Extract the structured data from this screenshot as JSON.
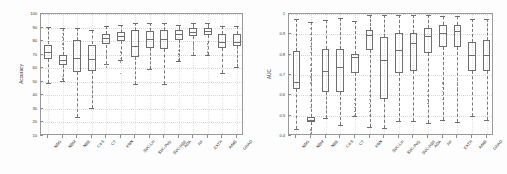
{
  "figure": {
    "background_color": "#fdfdfd",
    "box_line_color": "#6f6f6f",
    "whisker_color": "#7a7a7a",
    "outlier_color": "#8a8a8a",
    "axis_color": "#9a9a9a",
    "grid_color": "#d8d8d8"
  },
  "chart_data": [
    {
      "type": "box",
      "panel": "left",
      "title": "",
      "xlabel": "",
      "ylabel": "Accuracy",
      "ylim": [
        10,
        100
      ],
      "yticks": [
        10,
        20,
        30,
        40,
        50,
        60,
        70,
        80,
        90,
        100
      ],
      "ytick_labels": [
        "10",
        "20",
        "30",
        "40",
        "50",
        "60",
        "70",
        "80",
        "90",
        "100"
      ],
      "grid": true,
      "legend": "none",
      "categories": [
        "NBG",
        "NBM",
        "NBB",
        "C4.5",
        "CT",
        "KNN",
        "SVC-Lin",
        "SVC-Poly",
        "SVC-RBF",
        "ADA",
        "RF",
        "EXTR",
        "AdaB",
        "GRAD"
      ],
      "boxes": [
        {
          "category": "NBG",
          "whisker_low": 49.0,
          "q1": 66.5,
          "median": 72.0,
          "q3": 77.5,
          "whisker_high": 90.5,
          "outliers": [
            58.0,
            55.5,
            50.0
          ]
        },
        {
          "category": "NBM",
          "whisker_low": 50.5,
          "q1": 62.5,
          "median": 66.0,
          "q3": 69.5,
          "whisker_high": 90.0,
          "outliers": [
            88.0,
            85.5,
            83.0,
            80.5,
            78.0,
            75.5,
            54.0,
            52.0,
            50.0
          ]
        },
        {
          "category": "NBB",
          "whisker_low": 24.0,
          "q1": 57.5,
          "median": 67.5,
          "q3": 80.5,
          "whisker_high": 90.0,
          "outliers": []
        },
        {
          "category": "C4.5",
          "whisker_low": 31.0,
          "q1": 58.0,
          "median": 66.5,
          "q3": 77.5,
          "whisker_high": 88.0,
          "outliers": []
        },
        {
          "category": "CT",
          "whisker_low": 63.0,
          "q1": 77.5,
          "median": 82.0,
          "q3": 85.5,
          "whisker_high": 91.0,
          "outliers": [
            70.0,
            67.5,
            65.0,
            63.0,
            61.0
          ]
        },
        {
          "category": "KNN",
          "whisker_low": 66.0,
          "q1": 80.0,
          "median": 84.0,
          "q3": 87.0,
          "whisker_high": 92.0,
          "outliers": [
            72.0,
            69.5,
            67.0,
            64.5,
            56.0
          ]
        },
        {
          "category": "SVC-Lin",
          "whisker_low": 48.0,
          "q1": 68.0,
          "median": 76.5,
          "q3": 88.0,
          "whisker_high": 93.0,
          "outliers": []
        },
        {
          "category": "SVC-Poly",
          "whisker_low": 59.5,
          "q1": 75.0,
          "median": 81.5,
          "q3": 87.5,
          "whisker_high": 93.0,
          "outliers": []
        },
        {
          "category": "SVC-RBF",
          "whisker_low": 48.0,
          "q1": 74.5,
          "median": 81.5,
          "q3": 88.5,
          "whisker_high": 93.0,
          "outliers": []
        },
        {
          "category": "ADA",
          "whisker_low": 65.5,
          "q1": 81.0,
          "median": 85.0,
          "q3": 88.0,
          "whisker_high": 92.0,
          "outliers": [
            73.0,
            70.5,
            68.5,
            66.0
          ]
        },
        {
          "category": "RF",
          "whisker_low": 70.0,
          "q1": 84.0,
          "median": 87.0,
          "q3": 89.5,
          "whisker_high": 93.0,
          "outliers": [
            77.0,
            75.0,
            73.0,
            71.0
          ]
        },
        {
          "category": "EXTR",
          "whisker_low": 70.0,
          "q1": 84.5,
          "median": 87.5,
          "q3": 90.0,
          "whisker_high": 93.5,
          "outliers": [
            78.0,
            76.0,
            74.0,
            72.0,
            70.0
          ]
        },
        {
          "category": "AdaB",
          "whisker_low": 56.5,
          "q1": 75.0,
          "median": 79.5,
          "q3": 85.0,
          "whisker_high": 91.0,
          "outliers": []
        },
        {
          "category": "GRAD",
          "whisker_low": 61.0,
          "q1": 76.5,
          "median": 79.5,
          "q3": 85.5,
          "whisker_high": 91.0,
          "outliers": []
        }
      ]
    },
    {
      "type": "box",
      "panel": "right",
      "title": "",
      "xlabel": "",
      "ylabel": "AUC",
      "ylim": [
        0.4,
        1.0
      ],
      "yticks": [
        0.4,
        0.5,
        0.6,
        0.7,
        0.8,
        0.9,
        1.0
      ],
      "ytick_labels": [
        "0.4",
        "0.5",
        "0.6",
        "0.7",
        "0.8",
        "0.9",
        "1"
      ],
      "grid": true,
      "legend": "none",
      "categories": [
        "NBG",
        "NBM",
        "NBB",
        "C4.5",
        "CT",
        "KNN",
        "SVC-Lin",
        "SVC-Poly",
        "SVC-RBF",
        "ADA",
        "RF",
        "EXTR",
        "AdaB",
        "GRAD"
      ],
      "boxes": [
        {
          "category": "NBG",
          "whisker_low": 0.435,
          "q1": 0.63,
          "median": 0.668,
          "q3": 0.82,
          "whisker_high": 0.975,
          "outliers": []
        },
        {
          "category": "NBM",
          "whisker_low": 0.405,
          "q1": 0.468,
          "median": 0.477,
          "q3": 0.492,
          "whisker_high": 0.96,
          "outliers": [
            0.93,
            0.9,
            0.87,
            0.84,
            0.81,
            0.78,
            0.75,
            0.72,
            0.69,
            0.66,
            0.63,
            0.6,
            0.57,
            0.54,
            0.43,
            0.41
          ]
        },
        {
          "category": "NBB",
          "whisker_low": 0.49,
          "q1": 0.615,
          "median": 0.722,
          "q3": 0.828,
          "whisker_high": 0.972,
          "outliers": []
        },
        {
          "category": "C4.5",
          "whisker_low": 0.455,
          "q1": 0.615,
          "median": 0.737,
          "q3": 0.83,
          "whisker_high": 0.978,
          "outliers": []
        },
        {
          "category": "CT",
          "whisker_low": 0.497,
          "q1": 0.71,
          "median": 0.79,
          "q3": 0.805,
          "whisker_high": 0.965,
          "outliers": [
            0.58,
            0.56,
            0.54,
            0.52,
            0.5
          ]
        },
        {
          "category": "KNN",
          "whisker_low": 0.445,
          "q1": 0.825,
          "median": 0.895,
          "q3": 0.92,
          "whisker_high": 0.995,
          "outliers": [
            0.62,
            0.6,
            0.58,
            0.56,
            0.54,
            0.52,
            0.5
          ]
        },
        {
          "category": "SVC-Lin",
          "whisker_low": 0.44,
          "q1": 0.58,
          "median": 0.775,
          "q3": 0.888,
          "whisker_high": 0.995,
          "outliers": []
        },
        {
          "category": "SVC-Poly",
          "whisker_low": 0.475,
          "q1": 0.712,
          "median": 0.822,
          "q3": 0.905,
          "whisker_high": 0.995,
          "outliers": []
        },
        {
          "category": "SVC-RBF",
          "whisker_low": 0.475,
          "q1": 0.718,
          "median": 0.855,
          "q3": 0.905,
          "whisker_high": 0.995,
          "outliers": []
        },
        {
          "category": "ADA",
          "whisker_low": 0.462,
          "q1": 0.81,
          "median": 0.89,
          "q3": 0.932,
          "whisker_high": 0.995,
          "outliers": [
            0.62,
            0.6,
            0.58,
            0.56
          ]
        },
        {
          "category": "RF",
          "whisker_low": 0.48,
          "q1": 0.838,
          "median": 0.905,
          "q3": 0.945,
          "whisker_high": 0.99,
          "outliers": [
            0.66,
            0.64,
            0.62,
            0.6,
            0.58
          ]
        },
        {
          "category": "EXTR",
          "whisker_low": 0.47,
          "q1": 0.84,
          "median": 0.918,
          "q3": 0.948,
          "whisker_high": 0.992,
          "outliers": [
            0.68,
            0.66,
            0.64,
            0.62,
            0.6,
            0.58
          ]
        },
        {
          "category": "AdaB",
          "whisker_low": 0.498,
          "q1": 0.718,
          "median": 0.8,
          "q3": 0.862,
          "whisker_high": 0.975,
          "outliers": []
        },
        {
          "category": "GRAD",
          "whisker_low": 0.478,
          "q1": 0.718,
          "median": 0.8,
          "q3": 0.872,
          "whisker_high": 0.975,
          "outliers": []
        }
      ]
    }
  ]
}
